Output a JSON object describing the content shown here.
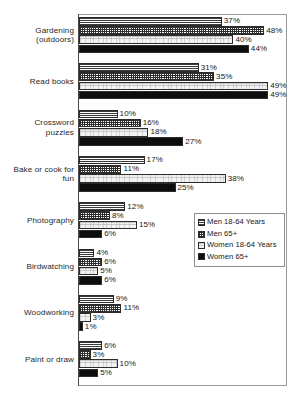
{
  "chart_data": {
    "type": "bar",
    "orientation": "horizontal",
    "title": "",
    "xlabel": "",
    "ylabel": "",
    "xlim": [
      0,
      54
    ],
    "grid": false,
    "legend_position": "middle-right inside plot",
    "value_suffix": "%",
    "categories": [
      "Gardening (outdoors)",
      "Read books",
      "Crossword puzzles",
      "Bake or cook for fun",
      "Photography",
      "Birdwatching",
      "Woodworking",
      "Paint or draw"
    ],
    "series": [
      {
        "name": "Men 18-64 Years",
        "pattern": "horizontal-lines",
        "values": [
          37,
          31,
          10,
          17,
          12,
          4,
          9,
          6
        ]
      },
      {
        "name": "Men 65+",
        "pattern": "crosshatch-grid",
        "values": [
          48,
          35,
          16,
          11,
          8,
          6,
          11,
          3
        ]
      },
      {
        "name": "Women 18-64 Years",
        "pattern": "light-stipple",
        "values": [
          40,
          49,
          18,
          38,
          15,
          5,
          3,
          10
        ]
      },
      {
        "name": "Women 65+",
        "pattern": "solid-black",
        "values": [
          44,
          49,
          27,
          25,
          6,
          6,
          1,
          5
        ]
      }
    ],
    "data_labels": [
      [
        "37%",
        "48%",
        "40%",
        "44%"
      ],
      [
        "31%",
        "35%",
        "49%",
        "49%"
      ],
      [
        "10%",
        "16%",
        "18%",
        "27%"
      ],
      [
        "17%",
        "11%",
        "38%",
        "25%"
      ],
      [
        "12%",
        "8%",
        "15%",
        "6%"
      ],
      [
        "4%",
        "6%",
        "5%",
        "6%"
      ],
      [
        "9%",
        "11%",
        "3%",
        "1%"
      ],
      [
        "6%",
        "3%",
        "10%",
        "5%"
      ]
    ]
  },
  "legend": {
    "items": [
      {
        "label": "Men 18-64 Years"
      },
      {
        "label": "Men 65+"
      },
      {
        "label": "Women 18-64 Years"
      },
      {
        "label": "Women 65+"
      }
    ]
  },
  "colors": {
    "plot_border": "#9a9a9a",
    "axis": "#4a4a4a",
    "bar_outline": "#2b2b2b",
    "solid_fill": "#0d0d0d",
    "light_fill": "#f2f2f2",
    "text": "#161616",
    "background": "#ffffff"
  }
}
